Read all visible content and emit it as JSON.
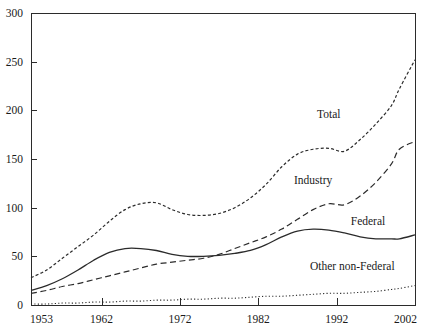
{
  "chart_data": {
    "type": "line",
    "title": "",
    "subtitle": "",
    "xlabel": "",
    "ylabel": "",
    "xlim": [
      1953,
      2002
    ],
    "ylim": [
      0,
      300
    ],
    "grid": false,
    "legend_position": "inline-labels",
    "y_ticks": [
      "0",
      "50",
      "100",
      "150",
      "200",
      "250",
      "300"
    ],
    "y_tick_values": [
      0,
      50,
      100,
      150,
      200,
      250,
      300
    ],
    "x_ticks": [
      "1953",
      "1962",
      "1972",
      "1982",
      "1992",
      "2002"
    ],
    "x_tick_values": [
      1953,
      1962,
      1972,
      1982,
      1992,
      2002
    ],
    "x": [
      1953,
      1955,
      1957,
      1959,
      1961,
      1963,
      1965,
      1967,
      1969,
      1971,
      1973,
      1975,
      1977,
      1979,
      1981,
      1983,
      1985,
      1987,
      1989,
      1991,
      1993,
      1995,
      1997,
      1999,
      2000,
      2002
    ],
    "series": [
      {
        "name": "Total",
        "label": "Total",
        "style": "dotted",
        "values": [
          28,
          36,
          48,
          60,
          72,
          86,
          98,
          104,
          105,
          98,
          93,
          92,
          94,
          100,
          110,
          124,
          142,
          155,
          160,
          161,
          158,
          170,
          186,
          205,
          222,
          252
        ]
      },
      {
        "name": "Industry",
        "label": "Industry",
        "style": "dashed",
        "values": [
          12,
          15,
          19,
          22,
          26,
          30,
          34,
          38,
          42,
          44,
          46,
          48,
          52,
          58,
          64,
          70,
          78,
          88,
          98,
          104,
          103,
          112,
          126,
          145,
          160,
          168
        ]
      },
      {
        "name": "Federal",
        "label": "Federal",
        "style": "solid",
        "values": [
          15,
          20,
          27,
          36,
          46,
          54,
          58,
          58,
          56,
          52,
          50,
          50,
          51,
          53,
          56,
          62,
          70,
          76,
          78,
          77,
          74,
          70,
          68,
          68,
          68,
          72
        ]
      },
      {
        "name": "Other non-Federal",
        "label": "Other non-Federal",
        "style": "fine-dotted",
        "values": [
          1,
          1,
          2,
          2,
          3,
          3,
          4,
          4,
          5,
          5,
          6,
          6,
          7,
          7,
          8,
          9,
          9,
          10,
          11,
          12,
          12,
          13,
          14,
          16,
          17,
          20
        ]
      }
    ],
    "annotations": [
      {
        "text": "Total",
        "x": 1991,
        "y": 192
      },
      {
        "text": "Industry",
        "x": 1989,
        "y": 124
      },
      {
        "text": "Federal",
        "x": 1996,
        "y": 82
      },
      {
        "text": "Other non-Federal",
        "x": 1994,
        "y": 36
      }
    ]
  },
  "colors": {
    "ink": "#2b2b2b",
    "background": "#ffffff"
  }
}
